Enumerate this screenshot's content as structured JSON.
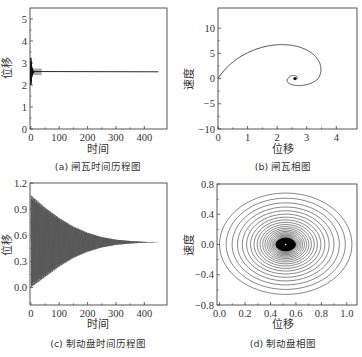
{
  "figure": {
    "panels": [
      {
        "id": "a",
        "caption": "(a) 闸瓦时间历程图"
      },
      {
        "id": "b",
        "caption": "(b) 闸瓦相图"
      },
      {
        "id": "c",
        "caption": "(c) 制动盘时间历程图"
      },
      {
        "id": "d",
        "caption": "(d) 制动盘相图"
      }
    ]
  },
  "chart_data": [
    {
      "panel": "a",
      "type": "line",
      "title": "(a) 闸瓦时间历程图",
      "xlabel": "时间",
      "ylabel": "位移",
      "xlim": [
        -3,
        480
      ],
      "ylim": [
        0,
        5.5
      ],
      "xticks": [
        0,
        100,
        200,
        300,
        400
      ],
      "yticks": [
        0,
        1,
        2,
        3,
        4,
        5
      ],
      "grid": false,
      "series": [
        {
          "name": "闸瓦位移",
          "description": "rapid oscillating transient near t=0 (range ~2.1–3.3) settling to steady value",
          "x": [
            0,
            2,
            4,
            6,
            10,
            20,
            50,
            100,
            200,
            300,
            400,
            450
          ],
          "y": [
            2.0,
            3.2,
            2.3,
            2.8,
            2.55,
            2.6,
            2.6,
            2.6,
            2.6,
            2.6,
            2.6,
            2.6
          ],
          "steady_value": 2.6
        }
      ]
    },
    {
      "panel": "b",
      "type": "line",
      "title": "(b) 闸瓦相图",
      "xlabel": "位移",
      "ylabel": "速度",
      "xlim": [
        0,
        4.7
      ],
      "ylim": [
        -10,
        14
      ],
      "xticks": [
        0,
        1,
        2,
        3,
        4
      ],
      "yticks": [
        -10,
        -5,
        0,
        5,
        10
      ],
      "grid": false,
      "series": [
        {
          "name": "相轨迹",
          "description": "inward spiral starting at (0,0) converging to focus (2.6, 0)",
          "start": [
            0,
            0
          ],
          "focus": [
            2.6,
            0
          ],
          "extrema": {
            "first_vmax": 11.5,
            "first_xmax": 4.35,
            "first_vmin": -7.5,
            "second_vmax": 4.5,
            "second_xmin": 1.6,
            "second_xmax": 3.45,
            "second_vmin": -3.0
          }
        }
      ]
    },
    {
      "panel": "c",
      "type": "line",
      "title": "(c) 制动盘时间历程图",
      "xlabel": "时间",
      "ylabel": "位移",
      "xlim": [
        -3,
        480
      ],
      "ylim": [
        -0.2,
        1.2
      ],
      "xticks": [
        0,
        100,
        200,
        300,
        400
      ],
      "yticks": [
        0.0,
        0.3,
        0.6,
        0.9,
        1.2
      ],
      "grid": false,
      "series": [
        {
          "name": "制动盘位移",
          "description": "dense decaying oscillation around 0.52; envelope upper ~1.06 at t=0, lower ~0.0 at t=0",
          "envelope_t": [
            0,
            50,
            100,
            150,
            200,
            250,
            300,
            350,
            400,
            450
          ],
          "envelope_upper": [
            1.06,
            0.92,
            0.8,
            0.7,
            0.63,
            0.58,
            0.55,
            0.535,
            0.525,
            0.52
          ],
          "envelope_lower": [
            0.0,
            0.12,
            0.24,
            0.34,
            0.41,
            0.46,
            0.49,
            0.505,
            0.515,
            0.52
          ],
          "center": 0.52
        }
      ]
    },
    {
      "panel": "d",
      "type": "line",
      "title": "(d) 制动盘相图",
      "xlabel": "位移",
      "ylabel": "速度",
      "xlim": [
        -0.02,
        1.08
      ],
      "ylim": [
        -0.8,
        0.8
      ],
      "xticks": [
        0.0,
        0.2,
        0.4,
        0.6,
        0.8,
        1.0
      ],
      "yticks": [
        -0.8,
        -0.4,
        0.0,
        0.4,
        0.8
      ],
      "grid": false,
      "series": [
        {
          "name": "相轨迹",
          "description": "many concentric near-elliptical loops spiralling inward to (0.52, 0); dense dark core",
          "center": [
            0.52,
            0.0
          ],
          "outer_x_range": [
            0.0,
            1.05
          ],
          "outer_v_range": [
            -0.66,
            0.68
          ]
        }
      ]
    }
  ]
}
